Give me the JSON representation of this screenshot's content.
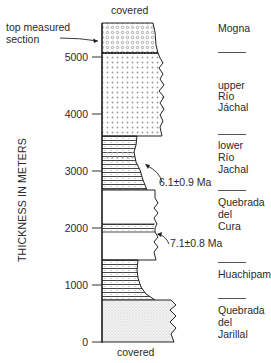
{
  "labels": {
    "covered_top": "covered",
    "covered_bottom": "covered",
    "top_measured_section": [
      "top measured",
      "section"
    ],
    "y_axis_title": "THICKNESS IN METERS"
  },
  "y_axis": {
    "ticks": [
      "5000",
      "4000",
      "3000",
      "2000",
      "1000",
      "0"
    ]
  },
  "formations": [
    {
      "name": "mogna",
      "lines": [
        "Mogna"
      ]
    },
    {
      "name": "upper-rio-jachal",
      "lines": [
        "upper",
        "Río",
        "Jáchal"
      ]
    },
    {
      "name": "lower-rio-jachal",
      "lines": [
        "lower",
        "Río",
        "Jachal"
      ]
    },
    {
      "name": "quebrada-del-cura",
      "lines": [
        "Quebrada",
        "del",
        "Cura"
      ]
    },
    {
      "name": "huachipampa",
      "lines": [
        "Huachipampa"
      ]
    },
    {
      "name": "quebrada-del-jarillal",
      "lines": [
        "Quebrada",
        "del",
        "Jarillal"
      ]
    }
  ],
  "ages": [
    {
      "label": "6.1±0.9 Ma"
    },
    {
      "label": "7.1±0.8 Ma"
    }
  ],
  "colors": {
    "line": "#222222",
    "dot": "#888888",
    "stipple": "#bdbdbd"
  }
}
